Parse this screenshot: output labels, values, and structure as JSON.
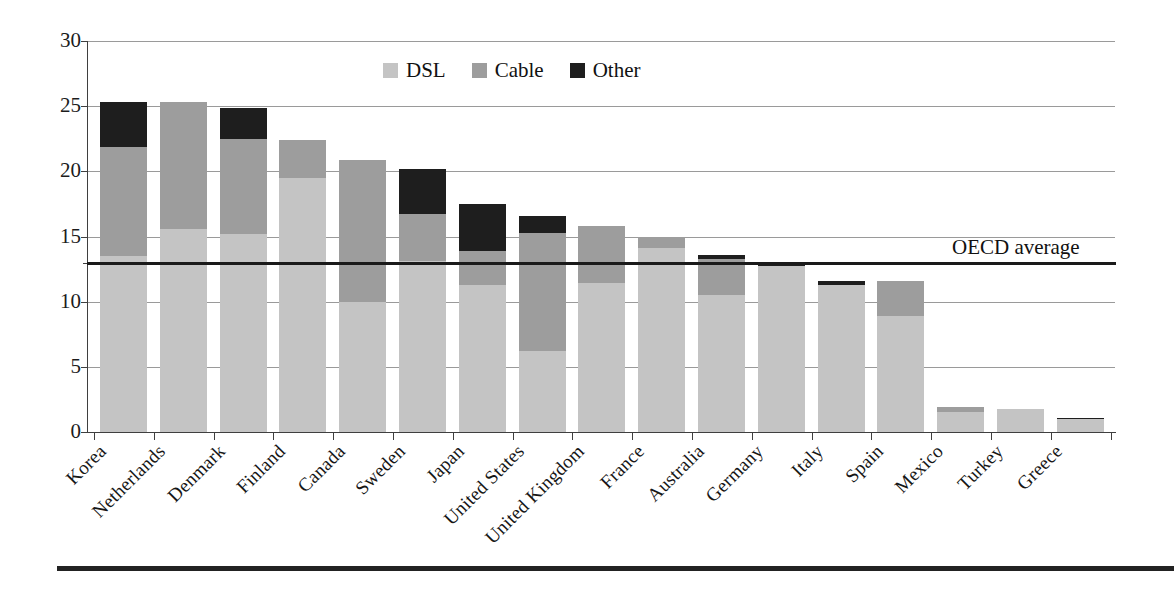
{
  "chart_data": {
    "type": "bar",
    "subtype": "stacked-bar",
    "title": "",
    "xlabel": "",
    "ylabel": "",
    "ylim": [
      0,
      30
    ],
    "ytick_step": 5,
    "ytick_labels": [
      "30",
      "25",
      "20",
      "15",
      "10",
      "5",
      "0"
    ],
    "grid": true,
    "legend_position": "top-center",
    "categories": [
      "Korea",
      "Netherlands",
      "Denmark",
      "Finland",
      "Canada",
      "Sweden",
      "Japan",
      "United States",
      "United Kingdom",
      "France",
      "Australia",
      "Germany",
      "Italy",
      "Spain",
      "Mexico",
      "Turkey",
      "Greece"
    ],
    "series": [
      {
        "name": "DSL",
        "color": "#c4c4c4",
        "values": [
          13.5,
          15.6,
          15.2,
          19.5,
          10.0,
          13.1,
          11.3,
          6.2,
          11.4,
          14.1,
          10.5,
          12.7,
          11.3,
          8.9,
          1.5,
          1.8,
          1.0
        ]
      },
      {
        "name": "Cable",
        "color": "#9d9d9d",
        "values": [
          8.4,
          9.7,
          7.3,
          2.9,
          10.9,
          3.6,
          2.6,
          9.1,
          4.4,
          0.9,
          2.8,
          0.0,
          0.0,
          2.7,
          0.4,
          0.0,
          0.0
        ]
      },
      {
        "name": "Other",
        "color": "#1e1e1e",
        "values": [
          3.4,
          0.0,
          2.4,
          0.0,
          0.0,
          3.5,
          3.6,
          1.3,
          0.0,
          0.0,
          0.3,
          0.2,
          0.3,
          0.0,
          0.0,
          0.0,
          0.1
        ]
      }
    ],
    "totals": [
      25.3,
      25.3,
      24.9,
      22.4,
      20.9,
      20.2,
      17.5,
      16.6,
      15.8,
      15.0,
      13.6,
      12.9,
      11.6,
      11.6,
      1.9,
      1.8,
      1.1
    ],
    "reference_line": {
      "label": "OECD average",
      "value": 13.0
    }
  },
  "legend": {
    "items": [
      {
        "label": "DSL",
        "color": "#c4c4c4"
      },
      {
        "label": "Cable",
        "color": "#9d9d9d"
      },
      {
        "label": "Other",
        "color": "#1e1e1e"
      }
    ]
  }
}
